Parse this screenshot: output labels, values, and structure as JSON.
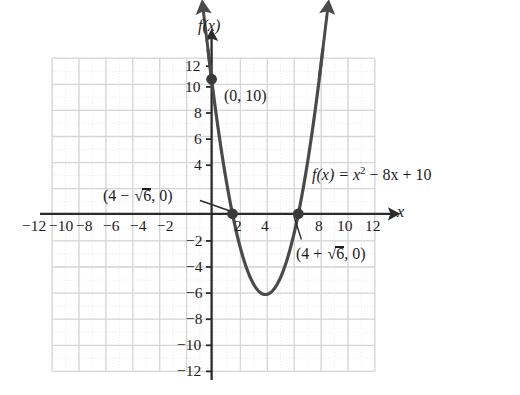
{
  "figure": {
    "kind": "cartesian-graph",
    "background": "#ffffff",
    "curve_color": "#4a4a4a",
    "axis_color": "#2b2b2b",
    "grid_major_color": "#d8d8d8",
    "grid_minor_color": "#e8e8e8",
    "axis_labels": {
      "x": "x",
      "y": "f(x)"
    },
    "equation": {
      "prefix": "f(x) = x",
      "exponent": "2",
      "suffix": " − 8x + 10",
      "full": "f(x) = x² − 8x + 10"
    },
    "annotations": [
      {
        "name": "y-intercept",
        "text": "(0, 10)",
        "x": 0,
        "y": 10,
        "leader": false
      },
      {
        "name": "left-root",
        "text": "(4 − √6, 0)",
        "pre": "(4 − ",
        "rad": "6",
        "post": ", 0)",
        "x": 1.551,
        "y": 0,
        "leader": true
      },
      {
        "name": "right-root",
        "text": "(4 + √6, 0)",
        "pre": "(4 + ",
        "rad": "6",
        "post": ", 0)",
        "x": 6.449,
        "y": 0,
        "leader": true
      }
    ]
  },
  "chart_data": {
    "type": "line",
    "title": "",
    "subtitle": "",
    "xlabel": "x",
    "ylabel": "f(x)",
    "xlim": [
      -12,
      12
    ],
    "ylim": [
      -12,
      12
    ],
    "grid": true,
    "legend": null,
    "x_ticks": [
      -12,
      -10,
      -8,
      -6,
      -4,
      -2,
      2,
      4,
      8,
      10,
      12
    ],
    "x_tick_labels": [
      "−12",
      "−10",
      "−8",
      "−6",
      "−4",
      "−2",
      "2",
      "4",
      "8",
      "10",
      "12"
    ],
    "y_ticks": [
      12,
      10,
      8,
      6,
      4,
      -2,
      -4,
      -6,
      -8,
      -10,
      -12
    ],
    "y_tick_labels": [
      "12",
      "10",
      "8",
      "6",
      "4",
      "−2",
      "−4",
      "−6",
      "−8",
      "−10",
      "−12"
    ],
    "grid_step": 2,
    "series": [
      {
        "name": "f(x) = x² − 8x + 10",
        "type": "parabola",
        "a": 1,
        "b": -8,
        "c": 10,
        "vertex": [
          4,
          -6
        ],
        "roots": [
          1.551,
          6.449
        ],
        "y_intercept": 10,
        "x_domain_drawn": [
          -0.25,
          8.35
        ],
        "arrow_start": true,
        "arrow_end": true
      }
    ],
    "points": [
      {
        "label": "(0, 10)",
        "x": 0,
        "y": 10,
        "marker": "filled-circle"
      },
      {
        "label": "(4 − √6, 0)",
        "x": 1.551,
        "y": 0,
        "marker": "filled-circle"
      },
      {
        "label": "(4 + √6, 0)",
        "x": 6.449,
        "y": 0,
        "marker": "filled-circle"
      }
    ],
    "annotations": [
      {
        "text": "f(x) = x² − 8x + 10",
        "x": 8.2,
        "y": 3.0
      },
      {
        "text": "(0, 10)",
        "x": 0.9,
        "y": 9.2
      },
      {
        "text": "(4 − √6, 0)",
        "x": -5.4,
        "y": 1.4
      },
      {
        "text": "(4 + √6, 0)",
        "x": 6.6,
        "y": -3.3
      }
    ]
  }
}
